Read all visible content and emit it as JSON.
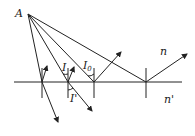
{
  "diagram": {
    "labels": {
      "point": "A",
      "upper_medium": "n",
      "lower_medium": "n'",
      "incidence_angle": "I",
      "critical_angle": "I",
      "critical_angle_sub": "0",
      "refraction_angle": "I'"
    },
    "rays": [
      {
        "name": "ray-1",
        "behavior": "partial reflection and refraction"
      },
      {
        "name": "ray-2",
        "behavior": "partial reflection and refraction, angle I / I'"
      },
      {
        "name": "ray-3",
        "behavior": "critical angle I0, reflected"
      },
      {
        "name": "ray-4",
        "behavior": "total internal reflection"
      }
    ]
  }
}
